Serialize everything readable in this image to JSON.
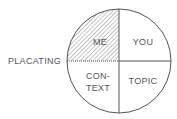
{
  "diagram": {
    "side_label": "PLACATING",
    "quadrants": [
      {
        "id": "me",
        "lines": [
          "ME"
        ],
        "hatched": true
      },
      {
        "id": "you",
        "lines": [
          "YOU"
        ],
        "hatched": false
      },
      {
        "id": "context",
        "lines": [
          "CON-",
          "TEXT"
        ],
        "hatched": false
      },
      {
        "id": "topic",
        "lines": [
          "TOPIC"
        ],
        "hatched": false
      }
    ],
    "colors": {
      "line": "#555555",
      "hatch": "#666666",
      "text": "#555555",
      "background": "#ffffff"
    }
  }
}
